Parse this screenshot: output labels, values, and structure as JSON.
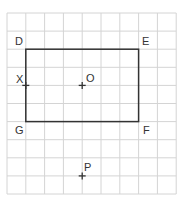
{
  "grid": {
    "x0": 7,
    "y0": 13,
    "cols": 9,
    "rows": 10,
    "cell_w": 18.8,
    "cell_h": 18.1,
    "color": "#d4d4d4"
  },
  "rectangle": {
    "color": "#333333",
    "vertices": {
      "D": [
        1,
        2
      ],
      "E": [
        7,
        2
      ],
      "F": [
        7,
        6
      ],
      "G": [
        1,
        6
      ]
    }
  },
  "labels": {
    "D": "D",
    "E": "E",
    "F": "F",
    "G": "G",
    "X": "X",
    "O": "O",
    "P": "P"
  },
  "points": {
    "X": [
      1,
      4
    ],
    "O": [
      4,
      4
    ],
    "P": [
      4,
      9
    ]
  }
}
